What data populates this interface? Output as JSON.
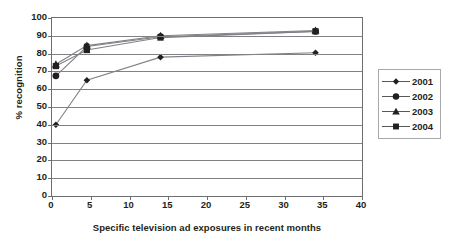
{
  "chart_data": {
    "type": "line",
    "title": "",
    "xlabel": "Specific television ad exposures in recent months",
    "ylabel": "% recognition",
    "xlim": [
      0,
      40
    ],
    "ylim": [
      0,
      100
    ],
    "xticks": [
      0,
      5,
      10,
      15,
      20,
      25,
      30,
      35,
      40
    ],
    "yticks": [
      0,
      10,
      20,
      30,
      40,
      50,
      60,
      70,
      80,
      90,
      100
    ],
    "grid": "horizontal",
    "legend_position": "right",
    "x": [
      0.5,
      4.5,
      14,
      34
    ],
    "series": [
      {
        "name": "2001",
        "marker": "diamond",
        "values": [
          40,
          65,
          78,
          80.5
        ]
      },
      {
        "name": "2002",
        "marker": "circle",
        "values": [
          67.5,
          84,
          89.5,
          92.5
        ]
      },
      {
        "name": "2003",
        "marker": "triangle",
        "values": [
          74,
          84.5,
          90,
          93
        ]
      },
      {
        "name": "2004",
        "marker": "square",
        "values": [
          73,
          82,
          89,
          92.5
        ]
      }
    ],
    "colors": {
      "line": "#808285",
      "marker": "#231f20",
      "axis": "#6d6e71",
      "text": "#231f20"
    }
  },
  "legend": {
    "items": [
      {
        "label": "2001",
        "marker": "diamond-marker-icon"
      },
      {
        "label": "2002",
        "marker": "circle-marker-icon"
      },
      {
        "label": "2003",
        "marker": "triangle-marker-icon"
      },
      {
        "label": "2004",
        "marker": "square-marker-icon"
      }
    ]
  }
}
